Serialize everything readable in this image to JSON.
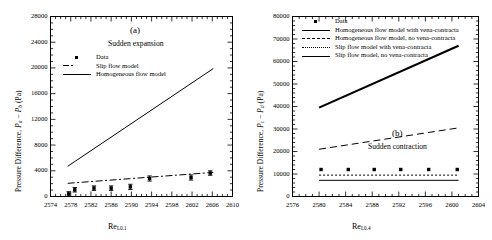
{
  "figure": {
    "panels": [
      {
        "tag": "(a)",
        "subtitle": "Sudden expansion",
        "xlabel_main": "Re",
        "xlabel_sub": "L0.1",
        "ylabel_prefix": "Pressure Difference, ",
        "ylabel_var1": "P",
        "ylabel_var1_sub": "a",
        "ylabel_minus": " − ",
        "ylabel_var2": "P",
        "ylabel_var2_sub": "b",
        "ylabel_units": " (Pa)",
        "legend": [
          {
            "label": "Data",
            "key": "marker-square"
          },
          {
            "label": "Slip flow model",
            "key": "line-dash-dot"
          },
          {
            "label": "Homogeneous flow model",
            "key": "line-solid"
          }
        ]
      },
      {
        "tag": "(b)",
        "subtitle": "Sudden contraction",
        "xlabel_main": "Re",
        "xlabel_sub": "L0.4",
        "ylabel_prefix": "Pressure Difference, ",
        "ylabel_var1": "P",
        "ylabel_var1_sub": "c",
        "ylabel_minus": " − ",
        "ylabel_var2": "P",
        "ylabel_var2_sub": "d",
        "ylabel_units": " (Pa)",
        "legend": [
          {
            "label": "Data",
            "key": "marker-square"
          },
          {
            "label": "Homogeneous flow model with vena-contracta",
            "key": "line-solid-thick"
          },
          {
            "label": "Homogeneous flow model, no vena-contracta",
            "key": "line-dashed"
          },
          {
            "label": "Slip flow model with vena-contracta",
            "key": "line-dotted"
          },
          {
            "label": "Slip flow model, no vena-contracta",
            "key": "line-solid"
          }
        ]
      }
    ]
  },
  "chart_data": [
    {
      "type": "scatter",
      "panel": "(a)",
      "title": "Sudden expansion",
      "xlabel": "Re_L0.1",
      "ylabel": "Pressure Difference, P_a - P_b (Pa)",
      "xlim": [
        2574,
        2610
      ],
      "ylim": [
        0,
        28000
      ],
      "xticks": [
        2574,
        2578,
        2582,
        2586,
        2590,
        2594,
        2598,
        2602,
        2606,
        2610
      ],
      "yticks": [
        0,
        4000,
        8000,
        12000,
        16000,
        20000,
        24000,
        28000
      ],
      "grid": false,
      "legend_position": "upper-left-inside",
      "series": [
        {
          "name": "Data",
          "style": "marker-square-with-errorbars",
          "x": [
            2577.6,
            2578.8,
            2582.6,
            2586.0,
            2589.8,
            2593.6,
            2601.8,
            2605.6
          ],
          "y": [
            400,
            1050,
            1300,
            1300,
            1500,
            2800,
            2950,
            3650
          ],
          "yerr": [
            350,
            350,
            350,
            350,
            400,
            400,
            400,
            350
          ]
        },
        {
          "name": "Slip flow model",
          "style": "line-dash-dot",
          "x": [
            2577.4,
            2606.2
          ],
          "y": [
            2050,
            3750
          ]
        },
        {
          "name": "Homogeneous flow model",
          "style": "line-solid",
          "x": [
            2577.4,
            2606.2
          ],
          "y": [
            4700,
            19900
          ]
        }
      ]
    },
    {
      "type": "scatter",
      "panel": "(b)",
      "title": "Sudden contraction",
      "xlabel": "Re_L0.4",
      "ylabel": "Pressure Difference, P_c - P_d (Pa)",
      "xlim": [
        2576,
        2604
      ],
      "ylim": [
        0,
        80000
      ],
      "xticks": [
        2576,
        2580,
        2584,
        2588,
        2592,
        2596,
        2600,
        2604
      ],
      "yticks": [
        0,
        10000,
        20000,
        30000,
        40000,
        50000,
        60000,
        70000,
        80000
      ],
      "grid": false,
      "legend_position": "upper-left-inside",
      "series": [
        {
          "name": "Data",
          "style": "marker-square",
          "x": [
            2580.3,
            2584.4,
            2588.3,
            2592.3,
            2596.5,
            2600.8
          ],
          "y": [
            12000,
            12000,
            12000,
            12000,
            12000,
            12000
          ]
        },
        {
          "name": "Homogeneous flow model with vena-contracta",
          "style": "line-solid-thick",
          "x": [
            2580.0,
            2601.0
          ],
          "y": [
            39500,
            67000
          ]
        },
        {
          "name": "Homogeneous flow model, no vena-contracta",
          "style": "line-dashed",
          "x": [
            2580.0,
            2601.0
          ],
          "y": [
            21000,
            30500
          ]
        },
        {
          "name": "Slip flow model with vena-contracta",
          "style": "line-dotted",
          "x": [
            2580.0,
            2601.0
          ],
          "y": [
            9500,
            9500
          ]
        },
        {
          "name": "Slip flow model, no vena-contracta",
          "style": "line-solid",
          "x": [
            2580.0,
            2601.0
          ],
          "y": [
            7200,
            7200
          ]
        }
      ]
    }
  ]
}
